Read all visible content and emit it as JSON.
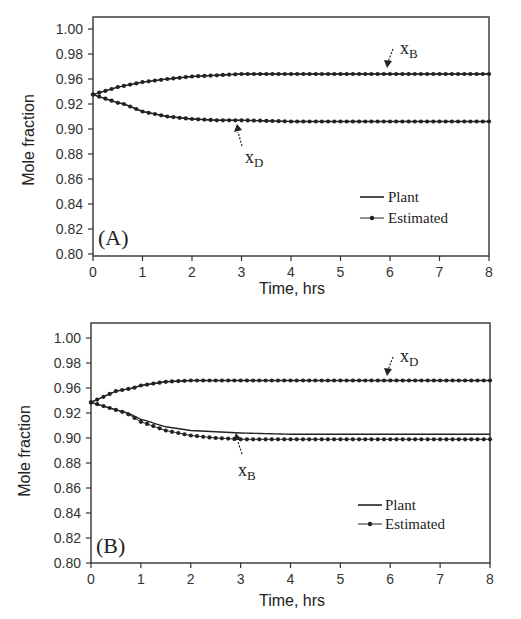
{
  "chart_data": [
    {
      "type": "line",
      "panel_label": "(A)",
      "xlabel": "Time, hrs",
      "ylabel": "Mole fraction",
      "x_ticks": [
        "0",
        "1",
        "2",
        "3",
        "4",
        "5",
        "6",
        "7",
        "8"
      ],
      "y_ticks": [
        "1.00",
        "0.98",
        "0.96",
        "0.92",
        "0.90",
        "0.88",
        "0.86",
        "0.84",
        "0.82",
        "0.80"
      ],
      "xlim": [
        0,
        8
      ],
      "ylim": [
        0.8,
        1.0
      ],
      "grid": false,
      "legend": {
        "position": "lower right",
        "entries": [
          "Plant",
          "Estimated"
        ]
      },
      "annotations": [
        {
          "text": "x",
          "sub": "B",
          "target": "upper curve"
        },
        {
          "text": "x",
          "sub": "D",
          "target": "lower curve"
        }
      ],
      "x": [
        0,
        0.5,
        1,
        1.5,
        2,
        2.5,
        3,
        4,
        5,
        6,
        7,
        8
      ],
      "series": [
        {
          "name": "xB Plant",
          "values": [
            0.935,
            0.947,
            0.955,
            0.96,
            0.962,
            0.963,
            0.964,
            0.964,
            0.964,
            0.964,
            0.964,
            0.964
          ]
        },
        {
          "name": "xB Estimated",
          "values": [
            0.935,
            0.947,
            0.955,
            0.96,
            0.962,
            0.963,
            0.964,
            0.964,
            0.964,
            0.964,
            0.964,
            0.964
          ]
        },
        {
          "name": "xD Plant",
          "values": [
            0.935,
            0.922,
            0.914,
            0.91,
            0.908,
            0.907,
            0.907,
            0.906,
            0.906,
            0.906,
            0.906,
            0.906
          ]
        },
        {
          "name": "xD Estimated",
          "values": [
            0.935,
            0.922,
            0.914,
            0.91,
            0.908,
            0.907,
            0.907,
            0.906,
            0.906,
            0.906,
            0.906,
            0.906
          ]
        }
      ]
    },
    {
      "type": "line",
      "panel_label": "(B)",
      "xlabel": "Time, hrs",
      "ylabel": "Mole fraction",
      "x_ticks": [
        "0",
        "1",
        "2",
        "3",
        "4",
        "5",
        "6",
        "7",
        "8"
      ],
      "y_ticks": [
        "1.00",
        "0.98",
        "0.96",
        "0.92",
        "0.90",
        "0.88",
        "0.86",
        "0.84",
        "0.82",
        "0.80"
      ],
      "xlim": [
        0,
        8
      ],
      "ylim": [
        0.8,
        1.0
      ],
      "grid": false,
      "legend": {
        "position": "lower right",
        "entries": [
          "Plant",
          "Estimated"
        ]
      },
      "annotations": [
        {
          "text": "x",
          "sub": "D",
          "target": "upper curve"
        },
        {
          "text": "x",
          "sub": "B",
          "target": "lower curve"
        }
      ],
      "x": [
        0,
        0.5,
        1,
        1.5,
        2,
        2.5,
        3,
        4,
        5,
        6,
        7,
        8
      ],
      "series": [
        {
          "name": "xD Plant",
          "values": [
            0.937,
            0.955,
            0.962,
            0.965,
            0.966,
            0.966,
            0.966,
            0.966,
            0.966,
            0.966,
            0.966,
            0.966
          ]
        },
        {
          "name": "xD Estimated",
          "values": [
            0.937,
            0.955,
            0.962,
            0.965,
            0.966,
            0.966,
            0.966,
            0.966,
            0.966,
            0.966,
            0.966,
            0.966
          ]
        },
        {
          "name": "xB Plant",
          "values": [
            0.937,
            0.925,
            0.915,
            0.909,
            0.906,
            0.905,
            0.904,
            0.903,
            0.903,
            0.903,
            0.903,
            0.903
          ]
        },
        {
          "name": "xB Estimated",
          "values": [
            0.937,
            0.925,
            0.913,
            0.906,
            0.902,
            0.9,
            0.899,
            0.899,
            0.899,
            0.899,
            0.899,
            0.899
          ]
        }
      ]
    }
  ],
  "panels": [
    {
      "label": "(A)",
      "xlabel": "Time, hrs",
      "ylabel": "Mole fraction",
      "upper_annot": {
        "main": "x",
        "sub": "B"
      },
      "lower_annot": {
        "main": "x",
        "sub": "D"
      },
      "legend": {
        "plant": "Plant",
        "estimated": "Estimated"
      }
    },
    {
      "label": "(B)",
      "xlabel": "Time, hrs",
      "ylabel": "Mole fraction",
      "upper_annot": {
        "main": "x",
        "sub": "D"
      },
      "lower_annot": {
        "main": "x",
        "sub": "B"
      },
      "legend": {
        "plant": "Plant",
        "estimated": "Estimated"
      }
    }
  ]
}
